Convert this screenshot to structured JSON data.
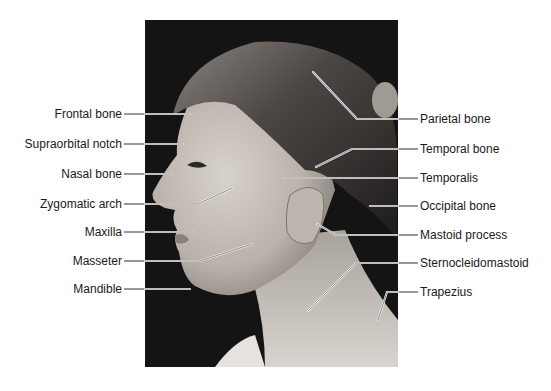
{
  "figure": {
    "labels_left": [
      {
        "id": "frontal-bone",
        "text": "Frontal bone",
        "x": 122,
        "y": 107
      },
      {
        "id": "supraorbital-notch",
        "text": "Supraorbital notch",
        "x": 122,
        "y": 137
      },
      {
        "id": "nasal-bone",
        "text": "Nasal bone",
        "x": 122,
        "y": 167
      },
      {
        "id": "zygomatic-arch",
        "text": "Zygomatic arch",
        "x": 122,
        "y": 197
      },
      {
        "id": "maxilla",
        "text": "Maxilla",
        "x": 122,
        "y": 225
      },
      {
        "id": "masseter",
        "text": "Masseter",
        "x": 122,
        "y": 254
      },
      {
        "id": "mandible",
        "text": "Mandible",
        "x": 122,
        "y": 282
      }
    ],
    "labels_right": [
      {
        "id": "parietal-bone",
        "text": "Parietal bone",
        "x": 420,
        "y": 112
      },
      {
        "id": "temporal-bone",
        "text": "Temporal bone",
        "x": 420,
        "y": 142
      },
      {
        "id": "temporalis",
        "text": "Temporalis",
        "x": 420,
        "y": 171
      },
      {
        "id": "occipital-bone",
        "text": "Occipital bone",
        "x": 420,
        "y": 199
      },
      {
        "id": "mastoid-process",
        "text": "Mastoid process",
        "x": 420,
        "y": 228
      },
      {
        "id": "sternocleidomastoid",
        "text": "Sternocleidomastoid",
        "x": 420,
        "y": 256
      },
      {
        "id": "trapezius",
        "text": "Trapezius",
        "x": 420,
        "y": 285
      }
    ]
  }
}
